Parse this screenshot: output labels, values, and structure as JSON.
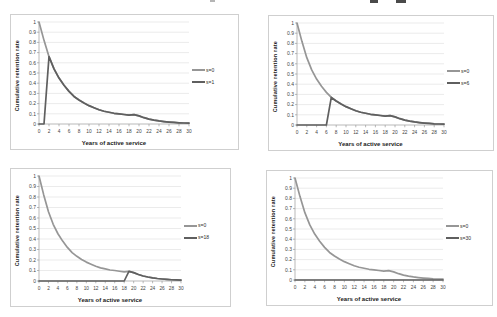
{
  "shared": {
    "ylabel": "Cumulative retention rate",
    "xlabel": "Years of active service",
    "y_tick_labels": [
      "0",
      "0.1",
      "0.2",
      "0.3",
      "0.4",
      "0.5",
      "0.6",
      "0.7",
      "0.8",
      "0.9",
      "1"
    ],
    "x_tick_values": [
      0,
      2,
      4,
      6,
      8,
      10,
      12,
      14,
      16,
      18,
      20,
      22,
      24,
      26,
      28,
      30
    ],
    "colors": {
      "series1": "#969696",
      "series2": "#5f5f5f",
      "gridline": "#e2e2e2",
      "axis": "#9b9b9b",
      "tick_text": "#3f3f3f"
    }
  },
  "chart_data": [
    {
      "type": "line",
      "xlabel": "Years of active service",
      "ylabel": "Cumulative retention rate",
      "xlim": [
        0,
        30
      ],
      "ylim": [
        0,
        1
      ],
      "grid": "horizontal",
      "legend_position": "right",
      "x": [
        0,
        1,
        2,
        3,
        4,
        5,
        6,
        7,
        8,
        9,
        10,
        11,
        12,
        13,
        14,
        15,
        16,
        17,
        18,
        19,
        20,
        21,
        22,
        23,
        24,
        25,
        26,
        27,
        28,
        29,
        30
      ],
      "series": [
        {
          "name": "s=0",
          "color": "#969696",
          "values": [
            1.0,
            0.82,
            0.66,
            0.54,
            0.45,
            0.38,
            0.32,
            0.27,
            0.235,
            0.205,
            0.18,
            0.16,
            0.14,
            0.125,
            0.115,
            0.105,
            0.1,
            0.093,
            0.087,
            0.092,
            0.08,
            0.062,
            0.048,
            0.038,
            0.03,
            0.024,
            0.019,
            0.015,
            0.012,
            0.01,
            0.008
          ]
        },
        {
          "name": "s=1",
          "color": "#5f5f5f",
          "values": [
            0,
            0,
            0.66,
            0.54,
            0.45,
            0.38,
            0.32,
            0.27,
            0.235,
            0.205,
            0.18,
            0.16,
            0.14,
            0.125,
            0.115,
            0.105,
            0.1,
            0.093,
            0.087,
            0.092,
            0.08,
            0.062,
            0.048,
            0.038,
            0.03,
            0.024,
            0.019,
            0.015,
            0.012,
            0.01,
            0.008
          ]
        }
      ]
    },
    {
      "type": "line",
      "xlabel": "Years of active service",
      "ylabel": "Cumulative retention rate",
      "xlim": [
        0,
        30
      ],
      "ylim": [
        0,
        1
      ],
      "grid": "horizontal",
      "legend_position": "right",
      "x": [
        0,
        1,
        2,
        3,
        4,
        5,
        6,
        7,
        8,
        9,
        10,
        11,
        12,
        13,
        14,
        15,
        16,
        17,
        18,
        19,
        20,
        21,
        22,
        23,
        24,
        25,
        26,
        27,
        28,
        29,
        30
      ],
      "series": [
        {
          "name": "s=0",
          "color": "#969696",
          "values": [
            1.0,
            0.82,
            0.66,
            0.54,
            0.45,
            0.38,
            0.32,
            0.27,
            0.235,
            0.205,
            0.18,
            0.16,
            0.14,
            0.125,
            0.115,
            0.105,
            0.1,
            0.093,
            0.087,
            0.092,
            0.08,
            0.062,
            0.048,
            0.038,
            0.03,
            0.024,
            0.019,
            0.015,
            0.012,
            0.01,
            0.008
          ]
        },
        {
          "name": "s=6",
          "color": "#5f5f5f",
          "values": [
            0,
            0,
            0,
            0,
            0,
            0,
            0,
            0.27,
            0.235,
            0.205,
            0.18,
            0.16,
            0.14,
            0.125,
            0.115,
            0.105,
            0.1,
            0.093,
            0.087,
            0.092,
            0.08,
            0.062,
            0.048,
            0.038,
            0.03,
            0.024,
            0.019,
            0.015,
            0.012,
            0.01,
            0.008
          ]
        }
      ]
    },
    {
      "type": "line",
      "xlabel": "Years of active service",
      "ylabel": "Cumulative retention rate",
      "xlim": [
        0,
        30
      ],
      "ylim": [
        0,
        1
      ],
      "grid": "horizontal",
      "legend_position": "right",
      "x": [
        0,
        1,
        2,
        3,
        4,
        5,
        6,
        7,
        8,
        9,
        10,
        11,
        12,
        13,
        14,
        15,
        16,
        17,
        18,
        19,
        20,
        21,
        22,
        23,
        24,
        25,
        26,
        27,
        28,
        29,
        30
      ],
      "series": [
        {
          "name": "s=0",
          "color": "#969696",
          "values": [
            1.0,
            0.82,
            0.66,
            0.54,
            0.45,
            0.38,
            0.32,
            0.27,
            0.235,
            0.205,
            0.18,
            0.16,
            0.14,
            0.125,
            0.115,
            0.105,
            0.1,
            0.093,
            0.087,
            0.092,
            0.08,
            0.062,
            0.048,
            0.038,
            0.03,
            0.024,
            0.019,
            0.015,
            0.012,
            0.01,
            0.008
          ]
        },
        {
          "name": "s=18",
          "color": "#5f5f5f",
          "values": [
            0,
            0,
            0,
            0,
            0,
            0,
            0,
            0,
            0,
            0,
            0,
            0,
            0,
            0,
            0,
            0,
            0,
            0,
            0,
            0.092,
            0.08,
            0.062,
            0.048,
            0.038,
            0.03,
            0.024,
            0.019,
            0.015,
            0.012,
            0.01,
            0.008
          ]
        }
      ]
    },
    {
      "type": "line",
      "xlabel": "Years of active service",
      "ylabel": "Cumulative retention rate",
      "xlim": [
        0,
        30
      ],
      "ylim": [
        0,
        1
      ],
      "grid": "horizontal",
      "legend_position": "right",
      "x": [
        0,
        1,
        2,
        3,
        4,
        5,
        6,
        7,
        8,
        9,
        10,
        11,
        12,
        13,
        14,
        15,
        16,
        17,
        18,
        19,
        20,
        21,
        22,
        23,
        24,
        25,
        26,
        27,
        28,
        29,
        30
      ],
      "series": [
        {
          "name": "s=0",
          "color": "#969696",
          "values": [
            1.0,
            0.82,
            0.66,
            0.54,
            0.45,
            0.38,
            0.32,
            0.27,
            0.235,
            0.205,
            0.18,
            0.16,
            0.14,
            0.125,
            0.115,
            0.105,
            0.1,
            0.093,
            0.087,
            0.092,
            0.08,
            0.062,
            0.048,
            0.038,
            0.03,
            0.024,
            0.019,
            0.015,
            0.012,
            0.01,
            0.008
          ]
        },
        {
          "name": "s=30",
          "color": "#5f5f5f",
          "values": [
            0,
            0,
            0,
            0,
            0,
            0,
            0,
            0,
            0,
            0,
            0,
            0,
            0,
            0,
            0,
            0,
            0,
            0,
            0,
            0,
            0,
            0,
            0,
            0,
            0,
            0,
            0,
            0,
            0,
            0,
            0
          ]
        }
      ]
    }
  ]
}
